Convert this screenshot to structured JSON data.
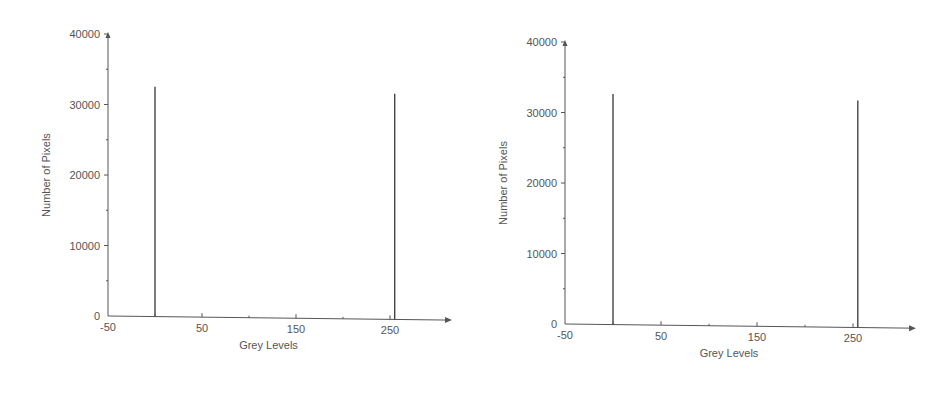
{
  "chart_data": [
    {
      "type": "bar",
      "title": "",
      "xlabel": "Grey Levels",
      "ylabel": "Number of Pixels",
      "xlim": [
        -50,
        300
      ],
      "ylim": [
        0,
        40000
      ],
      "x_ticks": [
        -50,
        50,
        150,
        250
      ],
      "x_tick_labels": [
        "-50",
        "50",
        "150",
        "250"
      ],
      "y_ticks": [
        0,
        10000,
        20000,
        30000,
        40000
      ],
      "y_tick_labels": [
        "0",
        "10000",
        "20000",
        "30000",
        "40000"
      ],
      "grid": false,
      "legend": null,
      "x": [
        0,
        255
      ],
      "values": [
        32600,
        32000
      ]
    },
    {
      "type": "bar",
      "title": "",
      "xlabel": "Grey Levels",
      "ylabel": "Number of Pixels",
      "xlim": [
        -50,
        300
      ],
      "ylim": [
        0,
        40000
      ],
      "x_ticks": [
        -50,
        50,
        150,
        250
      ],
      "x_tick_labels": [
        "-50",
        "50",
        "150",
        "250"
      ],
      "y_ticks": [
        0,
        10000,
        20000,
        30000,
        40000
      ],
      "y_tick_labels": [
        "0",
        "10000",
        "20000",
        "30000",
        "40000"
      ],
      "grid": false,
      "legend": null,
      "x": [
        0,
        255
      ],
      "values": [
        32700,
        32200
      ]
    }
  ],
  "colors": {
    "axis": "#555555",
    "bar": "#444444",
    "text": "#555555"
  }
}
